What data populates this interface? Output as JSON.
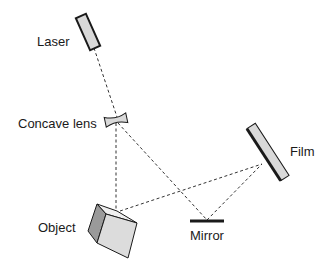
{
  "diagram": {
    "type": "holography-setup",
    "labels": {
      "laser": "Laser",
      "lens": "Concave lens",
      "film": "Film",
      "object": "Object",
      "mirror": "Mirror"
    },
    "colors": {
      "stroke": "#1a1a1a",
      "fill_light": "#d9d9d9",
      "fill_dark": "#9a9a9a",
      "beam": "#333333"
    }
  }
}
